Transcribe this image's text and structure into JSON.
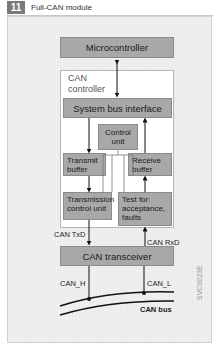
{
  "header": {
    "figure_number": "11",
    "title": "Full-CAN module"
  },
  "diagram": {
    "microcontroller": "Microcontroller",
    "can_controller_label_line1": "CAN",
    "can_controller_label_line2": "controller",
    "system_bus_interface": "System bus interface",
    "control_unit_line1": "Control",
    "control_unit_line2": "unit",
    "transmit_buffer_line1": "Transmit",
    "transmit_buffer_line2": "buffer",
    "receive_buffer_line1": "Receive",
    "receive_buffer_line2": "buffer",
    "transmission_control_line1": "Transmission",
    "transmission_control_line2": "control unit",
    "test_line1": "Test for:",
    "test_line2": "acceptance,",
    "test_line3": "faults",
    "can_txd": "CAN TxD",
    "can_rxd": "CAN RxD",
    "can_transceiver": "CAN transceiver",
    "can_h": "CAN_H",
    "can_l": "CAN_L",
    "can_bus": "CAN bus",
    "image_code": "SVC0023E"
  },
  "colors": {
    "block_fill": "#a8a8a8",
    "frame_bg": "#ececec",
    "controller_bg": "#ffffff",
    "number_badge": "#7a7a7a"
  }
}
